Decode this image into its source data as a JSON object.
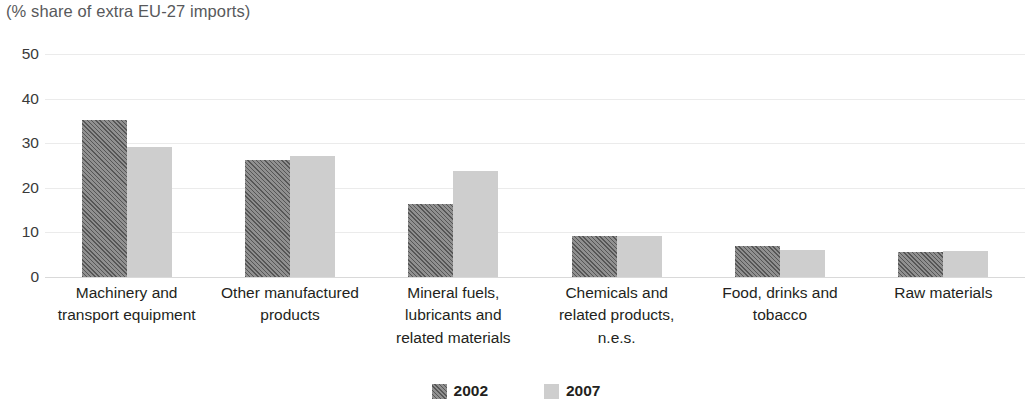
{
  "chart_data": {
    "type": "bar",
    "title": "",
    "subtitle": "(% share of extra EU-27 imports)",
    "xlabel": "",
    "ylabel": "",
    "ylim": [
      0,
      50
    ],
    "ytick_step": 10,
    "yticks": [
      "0",
      "10",
      "20",
      "30",
      "40",
      "50"
    ],
    "grid": true,
    "legend_position": "bottom-center",
    "categories": [
      "Machinery and\ntransport equipment",
      "Other manufactured\nproducts",
      "Mineral fuels,\nlubricants and\nrelated materials",
      "Chemicals and\nrelated products,\nn.e.s.",
      "Food, drinks and\ntobacco",
      "Raw materials"
    ],
    "category_lines": [
      [
        "Machinery and",
        "transport equipment"
      ],
      [
        "Other manufactured",
        "products"
      ],
      [
        "Mineral fuels,",
        "lubricants and",
        "related materials"
      ],
      [
        "Chemicals and",
        "related products,",
        "n.e.s."
      ],
      [
        "Food, drinks and",
        "tobacco"
      ],
      [
        "Raw materials"
      ]
    ],
    "series": [
      {
        "name": "2002",
        "color": "#7b7b7b",
        "pattern": "diagonal-hatch",
        "values": [
          35.2,
          26.2,
          16.3,
          9.3,
          7.0,
          5.5
        ]
      },
      {
        "name": "2007",
        "color": "#cecece",
        "pattern": "solid",
        "values": [
          29.2,
          27.1,
          23.7,
          9.2,
          6.0,
          5.8
        ]
      }
    ]
  },
  "legend": {
    "items": [
      {
        "label": "2002"
      },
      {
        "label": "2007"
      }
    ]
  },
  "colors": {
    "series_2002": "#7b7b7b",
    "series_2007": "#cecece",
    "gridline": "#ebebeb",
    "baseline": "#d9d9d9",
    "text": "#231f20",
    "subtitle_text": "#58595b"
  }
}
